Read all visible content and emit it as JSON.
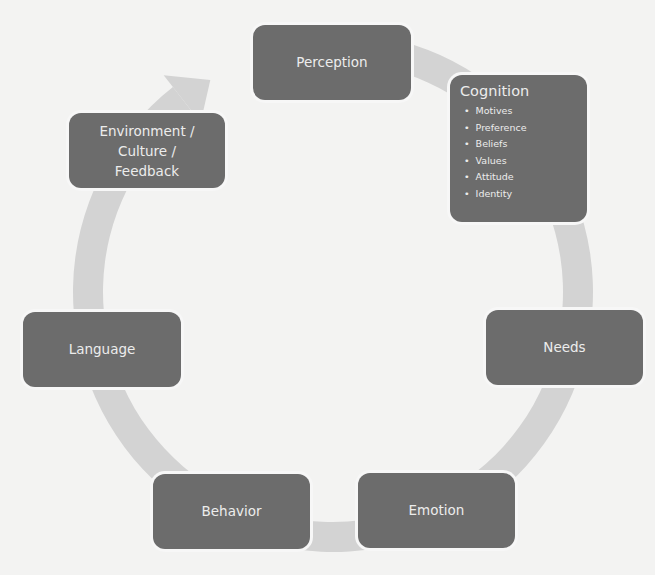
{
  "diagram": {
    "type": "cycle",
    "colors": {
      "background": "#f3f3f2",
      "node_fill": "#6c6c6c",
      "node_text": "#ececec",
      "ring": "#d3d3d3"
    },
    "nodes": [
      {
        "id": "perception",
        "label": "Perception"
      },
      {
        "id": "cognition",
        "label": "Cognition",
        "items": [
          "Motives",
          "Preference",
          "Beliefs",
          "Values",
          "Attitude",
          "Identity"
        ]
      },
      {
        "id": "needs",
        "label": "Needs"
      },
      {
        "id": "emotion",
        "label": "Emotion"
      },
      {
        "id": "behavior",
        "label": "Behavior"
      },
      {
        "id": "language",
        "label": "Language"
      },
      {
        "id": "environment",
        "label": "Environment /\nCulture /\nFeedback"
      }
    ],
    "flow": "clockwise",
    "arrow_target": "Perception"
  }
}
